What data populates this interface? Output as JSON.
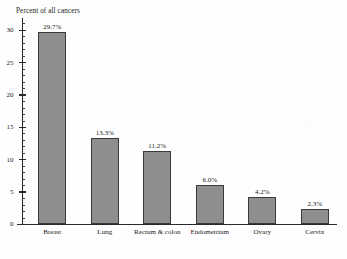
{
  "chart_data": {
    "type": "bar",
    "title": "Percent of all cancers",
    "xlabel": "",
    "ylabel": "Percent of all cancers",
    "ylim": [
      0,
      32
    ],
    "grid": false,
    "legend": null,
    "categories": [
      "Breast",
      "Lung",
      "Rectum & colon",
      "Endometrium",
      "Ovary",
      "Cervix"
    ],
    "values": [
      29.7,
      13.3,
      11.2,
      6.0,
      4.2,
      2.3
    ],
    "data_labels": [
      "29.7%",
      "13.3%",
      "11.2%",
      "6.0%",
      "4.2%",
      "2.3%"
    ],
    "ytick_labels": [
      "30",
      "25",
      "20",
      "15",
      "10",
      "5",
      "0"
    ],
    "ytick_values": [
      30,
      25,
      20,
      15,
      10,
      5,
      0
    ],
    "bar_color": "#8e8e8e",
    "bar_edge_color": "#3a3a3a",
    "axis_color": "#2a2a2a"
  }
}
